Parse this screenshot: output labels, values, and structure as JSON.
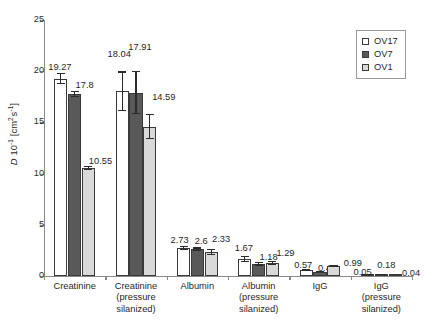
{
  "chart_data": {
    "type": "bar",
    "title": "",
    "xlabel": "",
    "ylabel": "D 10-1 [cm2 s-1]",
    "ylabel_parts": {
      "symbol": "D",
      "factor_base": "10",
      "factor_exp": "-1",
      "units_open": " [cm",
      "units_exp1": "2",
      "units_mid": " s",
      "units_exp2": "-1",
      "units_close": "]"
    },
    "ylim": [
      0,
      25
    ],
    "yticks": [
      0,
      5,
      10,
      15,
      20,
      25
    ],
    "ytick_labels": [
      "0",
      "5",
      "10",
      "15",
      "20",
      "25"
    ],
    "grid": false,
    "legend_position": "top-right",
    "categories": [
      "Creatinine",
      "Creatinine (pressure silanized)",
      "Albumin",
      "Albumin (pressure silanized)",
      "IgG",
      "IgG (pressure silanized)"
    ],
    "category_lines": [
      [
        "Creatinine"
      ],
      [
        "Creatinine",
        "(pressure",
        "silanized)"
      ],
      [
        "Albumin"
      ],
      [
        "Albumin",
        "(pressure",
        "silanized)"
      ],
      [
        "IgG"
      ],
      [
        "IgG",
        "(pressure",
        "silanized)"
      ]
    ],
    "series": [
      {
        "name": "OV17",
        "color": "#ffffff",
        "values": [
          19.27,
          18.04,
          2.73,
          1.67,
          0.57,
          0.05
        ],
        "errors": [
          0.55,
          1.95,
          0.22,
          0.28,
          0.09,
          0.05
        ]
      },
      {
        "name": "OV7",
        "color": "#595959",
        "values": [
          17.8,
          17.91,
          2.6,
          1.18,
          0.44,
          0.18
        ],
        "errors": [
          0.3,
          2.1,
          0.2,
          0.17,
          0.09,
          0.06
        ]
      },
      {
        "name": "OV1",
        "color": "#d9d9d9",
        "values": [
          10.55,
          14.59,
          2.33,
          1.29,
          0.99,
          0.04
        ],
        "errors": [
          0.18,
          1.25,
          0.28,
          0.2,
          0.12,
          0.04
        ]
      }
    ],
    "value_labels": [
      [
        "19.27",
        "17.8",
        "10.55"
      ],
      [
        "18.04",
        "17.91",
        "14.59"
      ],
      [
        "2.73",
        "2.6",
        "2.33"
      ],
      [
        "1.67",
        "1.18",
        "1.29"
      ],
      [
        "0.57",
        "0.44",
        "0.99"
      ],
      [
        "0.05",
        "0.18",
        "0.04"
      ]
    ]
  },
  "legend": {
    "items": [
      {
        "label": "OV17",
        "color": "#ffffff"
      },
      {
        "label": "OV7",
        "color": "#595959"
      },
      {
        "label": "OV1",
        "color": "#d9d9d9"
      }
    ]
  }
}
